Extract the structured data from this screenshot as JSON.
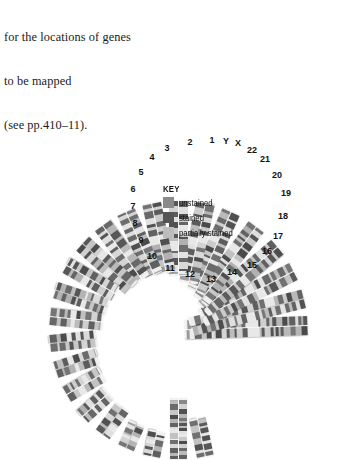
{
  "caption": {
    "line1": "for the locations of genes",
    "line2": "to be mapped",
    "line3": "(see pp.410–11)."
  },
  "key": {
    "title": "KEY",
    "items": [
      {
        "label": "unstained",
        "color": "#8a8a8a"
      },
      {
        "label": "stained",
        "color": "#555555"
      },
      {
        "label": "partially stained",
        "color": "#bcbcbc"
      }
    ]
  },
  "figure": {
    "type": "karyotype-circular",
    "center_x": 178,
    "center_y": 330,
    "chromosome_count": 24,
    "chromosomes": [
      {
        "label": "1",
        "angle": -2,
        "length": 124,
        "width": 9,
        "radius": 196,
        "bands": 26
      },
      {
        "label": "2",
        "angle": -14,
        "length": 118,
        "width": 9,
        "radius": 196,
        "bands": 24
      },
      {
        "label": "3",
        "angle": -27,
        "length": 104,
        "width": 9,
        "radius": 196,
        "bands": 21
      },
      {
        "label": "4",
        "angle": -40,
        "length": 98,
        "width": 9,
        "radius": 196,
        "bands": 19
      },
      {
        "label": "5",
        "angle": -53,
        "length": 94,
        "width": 9,
        "radius": 196,
        "bands": 19
      },
      {
        "label": "6",
        "angle": -66,
        "length": 88,
        "width": 9,
        "radius": 196,
        "bands": 18
      },
      {
        "label": "7",
        "angle": -78,
        "length": 82,
        "width": 9,
        "radius": 196,
        "bands": 16
      },
      {
        "label": "8",
        "angle": -90,
        "length": 76,
        "width": 9,
        "radius": 196,
        "bands": 15
      },
      {
        "label": "9",
        "angle": -102,
        "length": 72,
        "width": 9,
        "radius": 196,
        "bands": 14
      },
      {
        "label": "10",
        "angle": -114,
        "length": 70,
        "width": 9,
        "radius": 196,
        "bands": 14
      },
      {
        "label": "11",
        "angle": -126,
        "length": 68,
        "width": 9,
        "radius": 196,
        "bands": 13
      },
      {
        "label": "12",
        "angle": -138,
        "length": 67,
        "width": 9,
        "radius": 196,
        "bands": 13
      },
      {
        "label": "13",
        "angle": -150,
        "length": 58,
        "width": 8,
        "radius": 196,
        "bands": 11
      },
      {
        "label": "14",
        "angle": -162,
        "length": 56,
        "width": 8,
        "radius": 196,
        "bands": 11
      },
      {
        "label": "15",
        "angle": -174,
        "length": 54,
        "width": 8,
        "radius": 196,
        "bands": 10
      },
      {
        "label": "16",
        "angle": 174,
        "length": 48,
        "width": 8,
        "radius": 196,
        "bands": 9
      },
      {
        "label": "17",
        "angle": 162,
        "length": 45,
        "width": 8,
        "radius": 196,
        "bands": 9
      },
      {
        "label": "18",
        "angle": 150,
        "length": 42,
        "width": 8,
        "radius": 196,
        "bands": 8
      },
      {
        "label": "19",
        "angle": 138,
        "length": 36,
        "width": 8,
        "radius": 196,
        "bands": 7
      },
      {
        "label": "20",
        "angle": 126,
        "length": 35,
        "width": 8,
        "radius": 196,
        "bands": 7
      },
      {
        "label": "21",
        "angle": 114,
        "length": 28,
        "width": 8,
        "radius": 196,
        "bands": 6
      },
      {
        "label": "22",
        "angle": 102,
        "length": 27,
        "width": 8,
        "radius": 196,
        "bands": 6
      },
      {
        "label": "X",
        "angle": 90,
        "length": 62,
        "width": 8,
        "radius": 196,
        "bands": 13
      },
      {
        "label": "Y",
        "angle": 78,
        "length": 40,
        "width": 8,
        "radius": 196,
        "bands": 8
      }
    ],
    "labels": [
      {
        "text": "1",
        "x": 212,
        "y": 140
      },
      {
        "text": "2",
        "x": 190,
        "y": 142
      },
      {
        "text": "3",
        "x": 167,
        "y": 148
      },
      {
        "text": "4",
        "x": 152,
        "y": 157
      },
      {
        "text": "5",
        "x": 141,
        "y": 172
      },
      {
        "text": "6",
        "x": 133,
        "y": 189
      },
      {
        "text": "7",
        "x": 133,
        "y": 206
      },
      {
        "text": "8",
        "x": 135,
        "y": 223
      },
      {
        "text": "9",
        "x": 141,
        "y": 240
      },
      {
        "text": "10",
        "x": 152,
        "y": 256
      },
      {
        "text": "11",
        "x": 170,
        "y": 268
      },
      {
        "text": "12",
        "x": 190,
        "y": 274
      },
      {
        "text": "13",
        "x": 211,
        "y": 279
      },
      {
        "text": "14",
        "x": 232,
        "y": 272
      },
      {
        "text": "15",
        "x": 252,
        "y": 265
      },
      {
        "text": "16",
        "x": 267,
        "y": 251
      },
      {
        "text": "17",
        "x": 278,
        "y": 236
      },
      {
        "text": "18",
        "x": 283,
        "y": 216
      },
      {
        "text": "19",
        "x": 286,
        "y": 193
      },
      {
        "text": "20",
        "x": 277,
        "y": 175
      },
      {
        "text": "21",
        "x": 265,
        "y": 159
      },
      {
        "text": "22",
        "x": 252,
        "y": 150
      },
      {
        "text": "X",
        "x": 238,
        "y": 143
      },
      {
        "text": "Y",
        "x": 226,
        "y": 141
      }
    ]
  }
}
